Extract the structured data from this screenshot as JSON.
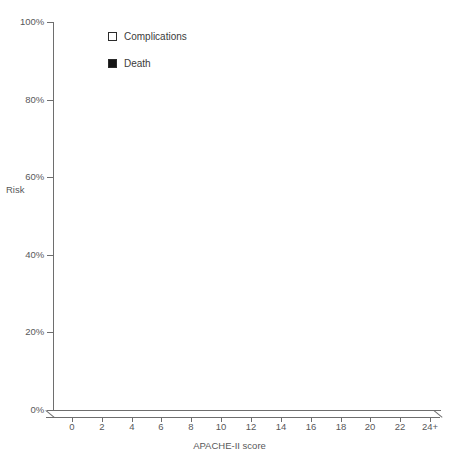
{
  "chart_data": {
    "type": "bar",
    "title": "",
    "xlabel": "APACHE-II score",
    "ylabel": "Risk",
    "categories": [
      "0",
      "2",
      "4",
      "6",
      "8",
      "10",
      "12",
      "14",
      "16",
      "18",
      "20",
      "22",
      "24+"
    ],
    "series": [
      {
        "name": "Complications",
        "color": "#ffffff",
        "values": [
          0,
          0,
          0,
          5,
          7,
          36,
          69,
          84,
          100,
          100,
          100,
          100,
          100
        ]
      },
      {
        "name": "Death",
        "color": "#141414",
        "values": [
          0,
          0,
          0,
          0,
          0,
          1,
          21,
          23,
          24,
          37,
          71,
          80,
          87
        ]
      }
    ],
    "ylim": [
      0,
      100
    ],
    "ytick_labels": [
      "0%",
      "20%",
      "40%",
      "60%",
      "80%",
      "100%"
    ],
    "ytick_values": [
      0,
      20,
      40,
      60,
      80,
      100
    ],
    "grid": false,
    "legend_position": "top-left-inside",
    "stacked": true,
    "style": "3d-column"
  },
  "axes": {
    "y_title": "Risk",
    "x_title": "APACHE-II score",
    "y_ticks": [
      {
        "label": "100%",
        "value": 100
      },
      {
        "label": "80%",
        "value": 80
      },
      {
        "label": "60%",
        "value": 60
      },
      {
        "label": "40%",
        "value": 40
      },
      {
        "label": "20%",
        "value": 20
      },
      {
        "label": "0%",
        "value": 0
      }
    ],
    "x_ticks": [
      {
        "label": "0"
      },
      {
        "label": "2"
      },
      {
        "label": "4"
      },
      {
        "label": "6"
      },
      {
        "label": "8"
      },
      {
        "label": "10"
      },
      {
        "label": "12"
      },
      {
        "label": "14"
      },
      {
        "label": "16"
      },
      {
        "label": "18"
      },
      {
        "label": "20"
      },
      {
        "label": "22"
      },
      {
        "label": "24+"
      }
    ]
  },
  "legend": {
    "items": [
      {
        "label": "Complications",
        "swatch": "hollow"
      },
      {
        "label": "Death",
        "swatch": "filled"
      }
    ]
  },
  "colors": {
    "death": "#141414",
    "complications": "#ffffff",
    "outline": "#2b2b2b",
    "axis": "#6e6e6e",
    "text": "#58585a"
  }
}
